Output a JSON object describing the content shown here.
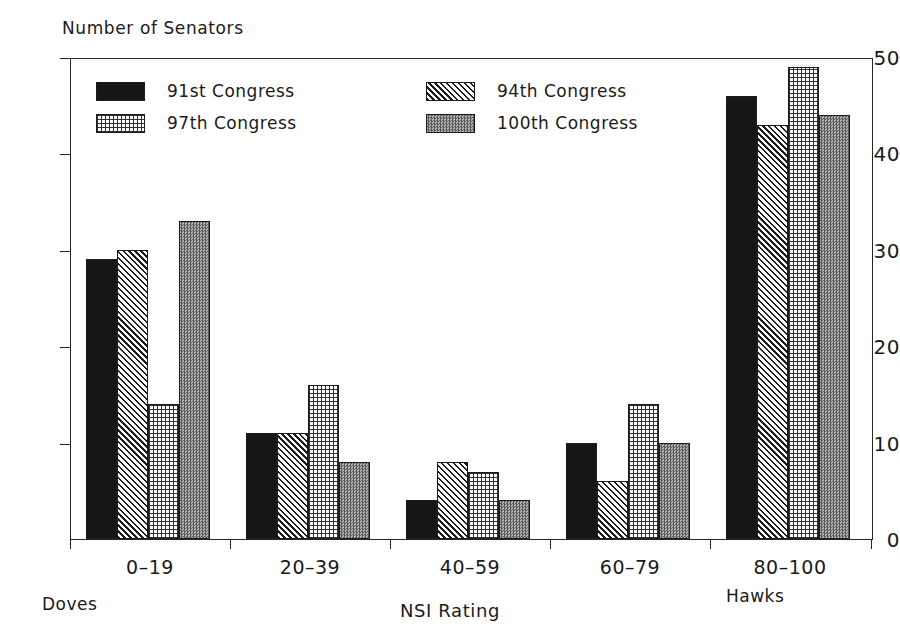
{
  "chart_data": {
    "type": "bar",
    "title": "",
    "ylabel": "Number of Senators",
    "xlabel": "NSI Rating",
    "categories": [
      "0–19",
      "20–39",
      "40–59",
      "60–79",
      "80–100"
    ],
    "series": [
      {
        "name": "91st Congress",
        "pattern": "solid",
        "values": [
          29,
          11,
          4,
          10,
          46
        ]
      },
      {
        "name": "94th Congress",
        "pattern": "hatch",
        "values": [
          30,
          11,
          8,
          6,
          43
        ]
      },
      {
        "name": "97th Congress",
        "pattern": "grid",
        "values": [
          14,
          16,
          7,
          14,
          49
        ]
      },
      {
        "name": "100th Congress",
        "pattern": "stipple",
        "values": [
          33,
          8,
          4,
          10,
          44
        ]
      }
    ],
    "ylim": [
      0,
      50
    ],
    "yticks": [
      0,
      10,
      20,
      30,
      40,
      50
    ],
    "ytick_labels": [
      "0",
      "10",
      "20",
      "30",
      "40",
      "50"
    ],
    "grid": false,
    "legend_position": "upper-left-inside",
    "annotations": [
      {
        "name": "doves",
        "text": "Doves",
        "position": "below-first-category"
      },
      {
        "name": "hawks",
        "text": "Hawks",
        "position": "below-last-category"
      }
    ]
  },
  "legend": {
    "entries": [
      {
        "label": "91st Congress"
      },
      {
        "label": "94th Congress"
      },
      {
        "label": "97th Congress"
      },
      {
        "label": "100th Congress"
      }
    ]
  },
  "axes": {
    "y_title": "Number of Senators",
    "x_title": "NSI Rating",
    "y_tick_labels": [
      "50",
      "40",
      "30",
      "20",
      "10",
      "0"
    ],
    "x_tick_labels": [
      "0–19",
      "20–39",
      "40–59",
      "60–79",
      "80–100"
    ]
  },
  "annotations": {
    "doves": "Doves",
    "hawks": "Hawks"
  },
  "colors": {
    "ink": "#1a1a1a",
    "background": "#ffffff",
    "series_solid": "#161616",
    "series_stipple": "#8e8e8e"
  }
}
